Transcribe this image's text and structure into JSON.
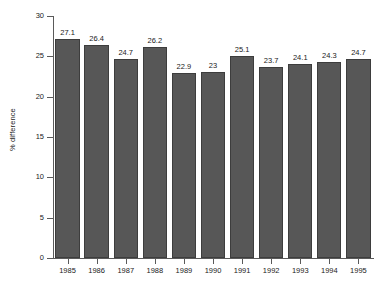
{
  "chart_data": {
    "type": "bar",
    "title": "",
    "xlabel": "",
    "ylabel": "% difference",
    "categories": [
      "1985",
      "1986",
      "1987",
      "1988",
      "1989",
      "1990",
      "1991",
      "1992",
      "1993",
      "1994",
      "1995"
    ],
    "values": [
      27.1,
      26.4,
      24.7,
      26.2,
      22.9,
      23,
      25.1,
      23.7,
      24.1,
      24.3,
      24.7
    ],
    "value_labels": [
      "27.1",
      "26.4",
      "24.7",
      "26.2",
      "22.9",
      "23",
      "25.1",
      "23.7",
      "24.1",
      "24.3",
      "24.7"
    ],
    "ylim": [
      0,
      30
    ],
    "yticks": [
      0,
      5,
      10,
      15,
      20,
      25,
      30
    ],
    "ytick_labels": [
      "0",
      "5",
      "10",
      "15",
      "20",
      "25",
      "30"
    ],
    "grid": false,
    "legend": false,
    "bar_color": "#575757",
    "bar_edge_color": "#3d3d3d",
    "axis_color": "#5a5a5a",
    "background_color": "#ffffff",
    "text_color": "#1a1a1a"
  }
}
